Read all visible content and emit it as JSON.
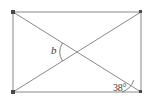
{
  "figure": {
    "name": "rectangle-with-diagonals",
    "background_color": "#ffffff",
    "stroke_color": "#8a8a8a",
    "label_color": "#3a3a3a",
    "vertex_marker_color": "#4a4a4a",
    "rectangle": {
      "left": 13,
      "top": 12,
      "right": 141,
      "bottom": 92,
      "width": 128,
      "height": 80,
      "vertices": [
        {
          "name": "top-left",
          "x": 13,
          "y": 12
        },
        {
          "name": "top-right",
          "x": 141,
          "y": 12
        },
        {
          "name": "bottom-right",
          "x": 141,
          "y": 92
        },
        {
          "name": "bottom-left",
          "x": 13,
          "y": 92
        }
      ]
    },
    "diagonals": [
      {
        "name": "diagonal-top-left-to-bottom-right",
        "x1": 13,
        "y1": 12,
        "x2": 141,
        "y2": 92
      },
      {
        "name": "diagonal-bottom-left-to-top-right",
        "x1": 13,
        "y1": 92,
        "x2": 141,
        "y2": 12
      }
    ],
    "intersection": {
      "name": "diagonal-intersection",
      "x": 77,
      "y": 52
    },
    "angles": [
      {
        "name": "angle-b",
        "label": "b",
        "value": null,
        "unit": "degrees",
        "location": "diagonal-intersection",
        "opens": "left",
        "arc_radius": 17
      },
      {
        "name": "angle-38",
        "label": "38°",
        "value": 38,
        "unit": "degrees",
        "location": "bottom-right-corner",
        "between": [
          "bottom-edge",
          "diagonal-top-left-to-bottom-right"
        ],
        "arc_radius": 19
      }
    ]
  }
}
